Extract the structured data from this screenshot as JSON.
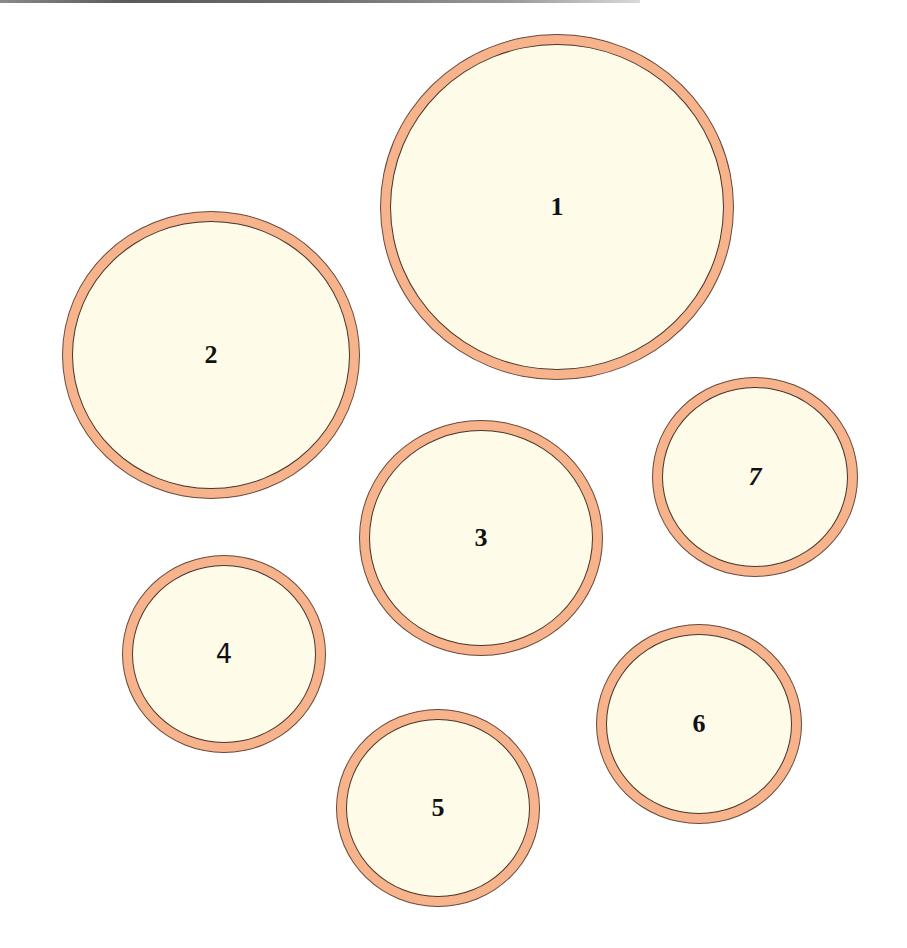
{
  "colors": {
    "ring": "#f6b38c",
    "fill": "#fefce9",
    "outline": "#4a3428",
    "label": "#111111",
    "background": "#ffffff"
  },
  "circles": [
    {
      "id": 1,
      "label": "1",
      "cx": 557,
      "cy": 207,
      "rx": 177,
      "ry": 173
    },
    {
      "id": 2,
      "label": "2",
      "cx": 211,
      "cy": 355,
      "rx": 149,
      "ry": 144
    },
    {
      "id": 3,
      "label": "3",
      "cx": 481,
      "cy": 538,
      "rx": 122,
      "ry": 118
    },
    {
      "id": 4,
      "label": "4",
      "cx": 224,
      "cy": 654,
      "rx": 102,
      "ry": 99
    },
    {
      "id": 5,
      "label": "5",
      "cx": 438,
      "cy": 808,
      "rx": 102,
      "ry": 99
    },
    {
      "id": 6,
      "label": "6",
      "cx": 699,
      "cy": 724,
      "rx": 103,
      "ry": 100
    },
    {
      "id": 7,
      "label": "7",
      "cx": 755,
      "cy": 477,
      "rx": 103,
      "ry": 100
    }
  ]
}
